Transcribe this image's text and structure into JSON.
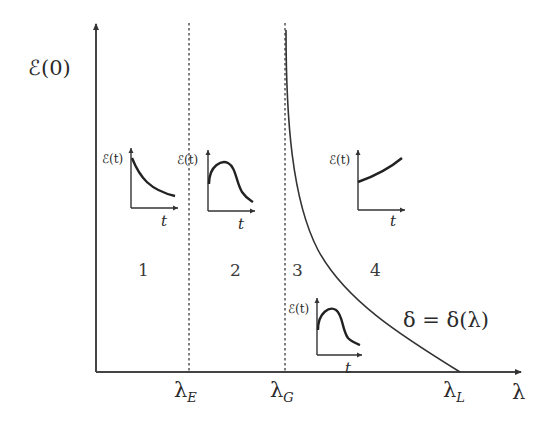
{
  "figure": {
    "y_axis_label": "ℰ(0)",
    "x_axis_label": "λ",
    "x_ticks": [
      {
        "symbol": "λ",
        "subscript": "E"
      },
      {
        "symbol": "λ",
        "subscript": "G"
      },
      {
        "symbol": "λ",
        "subscript": "L"
      }
    ],
    "regions": [
      "1",
      "2",
      "3",
      "4"
    ],
    "curve_label": "δ = δ(λ)",
    "insets": [
      {
        "region": "1",
        "ylabel": "ℰ(t)",
        "xlabel": "t",
        "shape": "monotone decreasing"
      },
      {
        "region": "2",
        "ylabel": "ℰ(t)",
        "xlabel": "t",
        "shape": "rise then fall"
      },
      {
        "region": "3",
        "ylabel": "ℰ(t)",
        "xlabel": "t",
        "shape": "rise then fall"
      },
      {
        "region": "4",
        "ylabel": "ℰ(t)",
        "xlabel": "t",
        "shape": "monotone increasing"
      }
    ]
  }
}
